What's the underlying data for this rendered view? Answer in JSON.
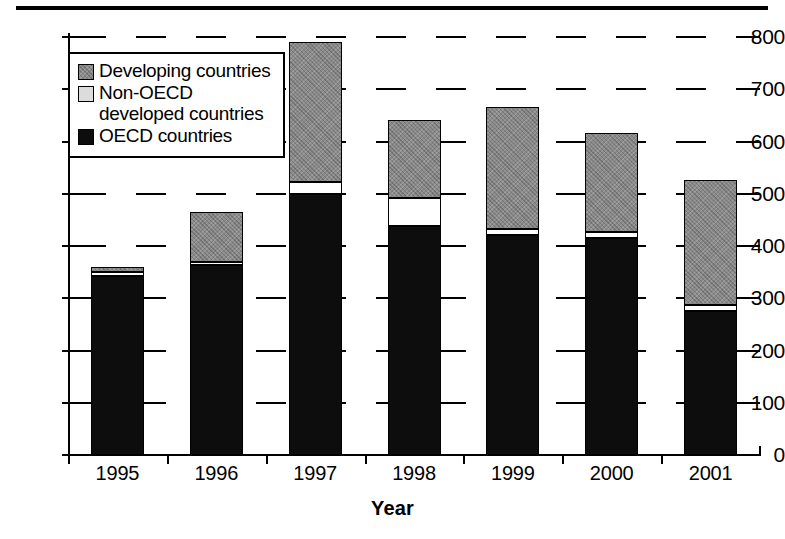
{
  "chart_data": {
    "type": "bar",
    "subtype": "stacked",
    "title": "",
    "xlabel": "Year",
    "ylabel": "",
    "categories": [
      "1995",
      "1996",
      "1997",
      "1998",
      "1999",
      "2000",
      "2001"
    ],
    "series": [
      {
        "name": "OECD countries",
        "key": "oecd",
        "color": "#0d0d0d",
        "values": [
          342,
          363,
          500,
          439,
          421,
          415,
          275
        ]
      },
      {
        "name": "Non-OECD developed countries",
        "key": "nonoecd",
        "color": "#ffffff",
        "values": [
          8,
          7,
          22,
          53,
          12,
          12,
          12
        ]
      },
      {
        "name": "Developing countries",
        "key": "dev",
        "color": "#8a8a8a",
        "values": [
          10,
          96,
          268,
          149,
          233,
          189,
          240
        ]
      }
    ],
    "stack_order": [
      "oecd",
      "nonoecd",
      "dev"
    ],
    "totals": [
      360,
      466,
      790,
      641,
      666,
      616,
      527
    ],
    "ylim": [
      0,
      800
    ],
    "yticks": [
      0,
      100,
      200,
      300,
      400,
      500,
      600,
      700,
      800
    ],
    "ytick_labels": [
      "0",
      "100",
      "200",
      "300",
      "400",
      "500",
      "600",
      "700",
      "800"
    ],
    "grid": true,
    "grid_style": "dashed",
    "legend_position": "upper-left-inside"
  },
  "legend": {
    "items": [
      {
        "label": "Developing countries",
        "swatch": "developing-swatch"
      },
      {
        "label": "Non-OECD\ndeveloped countries",
        "swatch": "non-oecd-swatch"
      },
      {
        "label": "OECD countries",
        "swatch": "oecd-swatch"
      }
    ]
  },
  "axis": {
    "x_title": "Year"
  }
}
